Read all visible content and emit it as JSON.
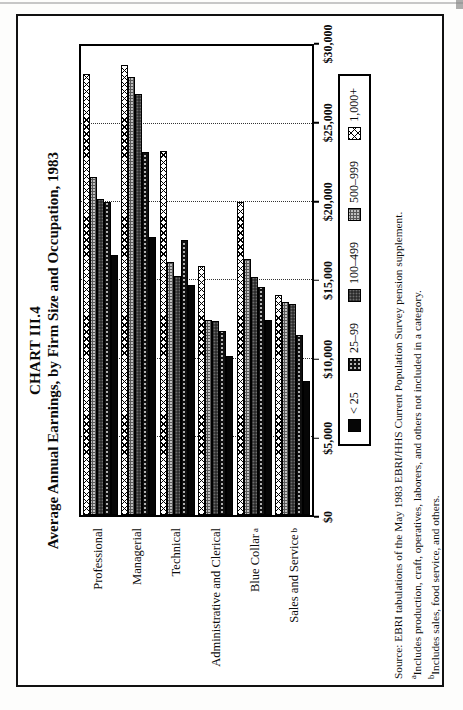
{
  "chart_data": {
    "type": "bar",
    "orientation": "horizontal-bars-rotated-90ccw-on-page",
    "title": "CHART III.4",
    "subtitle": "Average Annual Earnings, by Firm Size and Occupation, 1983",
    "categories": [
      "Professional",
      "Managerial",
      "Technical",
      "Administrative and Clerical",
      "Blue Collar",
      "Sales and Service"
    ],
    "category_sups": [
      "",
      "",
      "",
      "",
      "a",
      "b"
    ],
    "series_order_note": "top-to-bottom within each category group",
    "series": [
      {
        "name": "1,000+",
        "pattern": "diagonal-crosshatch",
        "values": [
          28200,
          28800,
          23300,
          15900,
          20000,
          14100
        ]
      },
      {
        "name": "500–999",
        "pattern": "gray-stipple",
        "values": [
          21600,
          28000,
          16200,
          12500,
          16400,
          13600
        ]
      },
      {
        "name": "100–499",
        "pattern": "dark-stipple",
        "values": [
          20200,
          26900,
          15300,
          12400,
          15200,
          13500
        ]
      },
      {
        "name": "25–99",
        "pattern": "black-dotted",
        "values": [
          20000,
          23200,
          17600,
          11800,
          14600,
          11500
        ]
      },
      {
        "name": "< 25",
        "pattern": "solid-black",
        "values": [
          16600,
          17800,
          14700,
          10200,
          12500,
          8600
        ]
      }
    ],
    "xlim": [
      0,
      30000
    ],
    "x_ticks": [
      "$0",
      "$5,000",
      "$10,000",
      "$15,000",
      "$20,000",
      "$25,000",
      "$30,000"
    ],
    "gridlines": "dotted vertical lines at $5,000 intervals",
    "legend_position": "boxed, below value axis"
  },
  "legend": {
    "items": [
      {
        "label": "< 25",
        "pattern": "solid-black"
      },
      {
        "label": "25–99",
        "pattern": "black-dotted"
      },
      {
        "label": "100–499",
        "pattern": "dark-stipple"
      },
      {
        "label": "500–999",
        "pattern": "gray-stipple"
      },
      {
        "label": "1,000+",
        "pattern": "diagonal-crosshatch"
      }
    ]
  },
  "source": {
    "line1": "Source:  EBRI tabulations of the May 1983 EBRI/HHS Current Population Survey pension supplement.",
    "line2_sup": "a",
    "line2": "Includes production, craft, operatives, laborers, and others not included in a category.",
    "line3_sup": "b",
    "line3": "Includes sales, food service, and others."
  },
  "colors": {
    "ink": "#0a0a0a",
    "paper": "#ffffff",
    "gray_stipple": "#bfbfbf",
    "dark_stipple": "#2e2e2e"
  }
}
